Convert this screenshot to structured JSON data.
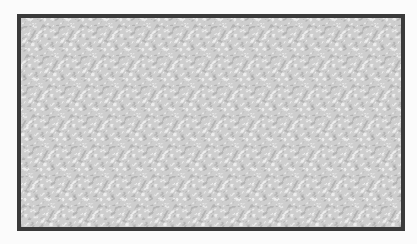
{
  "image": {
    "description": "Framed grayscale random-dot / camouflage texture with diagonally repeating pattern",
    "colors": {
      "page_background": "#fbfbfb",
      "frame_border": "#3a3a3a",
      "texture_dark": "#5a5a5a",
      "texture_mid": "#8c8c8c",
      "texture_light": "#e8e8e8"
    }
  }
}
